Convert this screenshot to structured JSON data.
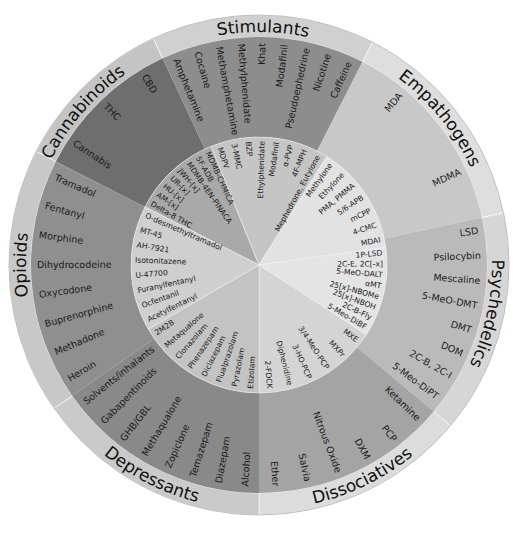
{
  "diagram": {
    "center": [
      259,
      265
    ],
    "radii": {
      "outer": 250,
      "ring": 228,
      "inner": 128
    },
    "categories": [
      {
        "name": "Cannabinoids",
        "start": -153,
        "end": -115,
        "ring_color": "#c4c4c4",
        "mid_color": "#6e6e6e",
        "inner_color": "#a9a9a9",
        "inner_start": -153,
        "inner_end": -112,
        "substances": [
          "Cannabis",
          "THC",
          "CBD"
        ],
        "research_chemicals": [
          "Delta-8 THC",
          "AM-[x]",
          "HU-[x]",
          "UR-[x]",
          "JWH-[x]",
          "MDMB-4EN-PINACA",
          "5F-ADB",
          "MDMB-CHMICA"
        ]
      },
      {
        "name": "Stimulants",
        "start": -115,
        "end": -63,
        "ring_color": "#d0d0d0",
        "mid_color": "#8d8d8d",
        "inner_color": "#c5c5c5",
        "inner_start": -112,
        "inner_end": -58,
        "substances": [
          "Amphetamine",
          "Cocaine",
          "Methamphetamine",
          "Methylphenidate",
          "Khat",
          "Modafinil",
          "Pseudoephedrine",
          "Nicotine",
          "Caffeine"
        ],
        "research_chemicals": [
          "MDPV",
          "3-MMC",
          "BZP",
          "Ethylphenidate",
          "Modafinil",
          "α-PVP",
          "4F-MPH",
          "Mephedrone, Eutylone"
        ]
      },
      {
        "name": "Empathogens",
        "start": -63,
        "end": -12,
        "ring_color": "#dedede",
        "mid_color": "#c8c8c8",
        "inner_color": "#e2e2e2",
        "inner_start": -58,
        "inner_end": -8,
        "substances": [
          "MDA",
          "MDMA"
        ],
        "research_chemicals": [
          "Methylone",
          "Ethylone",
          "PMA, PMMA",
          "5/6-APB",
          "mCPP",
          "4-CMC",
          "MDAI"
        ]
      },
      {
        "name": "Psychedelics",
        "start": -12,
        "end": 40,
        "ring_color": "#d6d6d6",
        "mid_color": "#bababa",
        "inner_color": "#e4e4e4",
        "inner_start": -8,
        "inner_end": 33,
        "substances": [
          "LSD",
          "Psilocybin",
          "Mescaline",
          "5-MeO-DMT",
          "DMT",
          "DOM",
          "2C-B, 2C-I",
          "5-Meo-DiPT"
        ],
        "research_chemicals": [
          "1P-LSD",
          "2C-E, 2C[-x]",
          "5-MeO-DALT",
          "αMT",
          "25[x]-NBOMe",
          "25[x]-NBOH",
          "2C-B-Fly",
          "5-Meo-DiBF"
        ]
      },
      {
        "name": "Dissociatives",
        "start": 40,
        "end": 90,
        "ring_color": "#dcdcdc",
        "mid_color": "#a4a4a4",
        "inner_color": "#d4d4d4",
        "inner_start": 33,
        "inner_end": 90,
        "substances": [
          "Ketamine",
          "PCP",
          "DXM",
          "Nitrous Oxide",
          "Salvia",
          "Ether"
        ],
        "research_chemicals": [
          "MXE",
          "MXPr",
          "3/4-MeO-PCP",
          "3-HO-PCP",
          "Diphenidine",
          "2-FDCK"
        ]
      },
      {
        "name": "Depressants",
        "start": 90,
        "end": 145,
        "ring_color": "#cacaca",
        "mid_color": "#898989",
        "inner_color": "#c3c3c3",
        "inner_start": 90,
        "inner_end": 150,
        "substances": [
          "Alcohol",
          "Diazepam",
          "Temazepam",
          "Zopiclone",
          "Methaqualone",
          "GHB/GBL",
          "Gabapentinoids",
          "Solvents/inhalants"
        ],
        "research_chemicals": [
          "Etizolam",
          "Pyrazolam",
          "Flualprazolam",
          "Diclazepam",
          "Phenazepam",
          "Clonazolam",
          "Metaqualone",
          "2M2B"
        ]
      },
      {
        "name": "Opioids",
        "start": 145,
        "end": 207,
        "ring_color": "#c8c8c8",
        "mid_color": "#8f8f8f",
        "inner_color": "#cfcfcf",
        "inner_start": 150,
        "inner_end": 207,
        "substances": [
          "Heroin",
          "Methadone",
          "Buprenorphine",
          "Oxycodone",
          "Dihydrocodeine",
          "Morphine",
          "Fentanyl",
          "Tramadol"
        ],
        "research_chemicals": [
          "Acetylfentanyl",
          "Ocfentanil",
          "Furanylfentanyl",
          "U-47700",
          "Isotonitazene",
          "AH-7921",
          "MT-45",
          "O-desmethyltramadol"
        ]
      }
    ],
    "category_label_angles": {
      "Cannabinoids": -139,
      "Stimulants": -89,
      "Empathogens": -39,
      "Psychedelics": 12,
      "Dissociatives": 64,
      "Depressants": 117,
      "Opioids": 180
    }
  }
}
